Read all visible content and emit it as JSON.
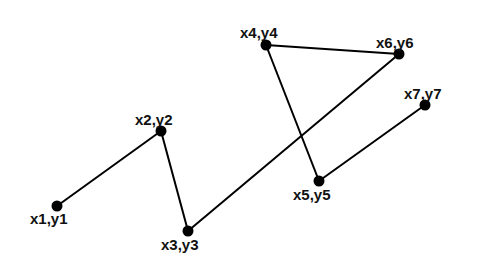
{
  "diagram": {
    "type": "polyline-graph",
    "background": "#ffffff",
    "stroke_color": "#000000",
    "points": [
      {
        "id": "p1",
        "label": "x1,y1",
        "x": 57,
        "y": 206,
        "label_x": 30,
        "label_y": 224
      },
      {
        "id": "p2",
        "label": "x2,y2",
        "x": 161,
        "y": 131,
        "label_x": 135,
        "label_y": 125
      },
      {
        "id": "p3",
        "label": "x3,y3",
        "x": 188,
        "y": 231,
        "label_x": 161,
        "label_y": 250
      },
      {
        "id": "p4",
        "label": "x4,y4",
        "x": 266,
        "y": 45,
        "label_x": 240,
        "label_y": 38
      },
      {
        "id": "p5",
        "label": "x5,y5",
        "x": 319,
        "y": 181,
        "label_x": 293,
        "label_y": 200
      },
      {
        "id": "p6",
        "label": "x6,y6",
        "x": 399,
        "y": 54,
        "label_x": 376,
        "label_y": 48
      },
      {
        "id": "p7",
        "label": "x7,y7",
        "x": 425,
        "y": 105,
        "label_x": 404,
        "label_y": 99
      }
    ],
    "edges": [
      [
        "p1",
        "p2"
      ],
      [
        "p2",
        "p3"
      ],
      [
        "p3",
        "p6"
      ],
      [
        "p4",
        "p6"
      ],
      [
        "p4",
        "p5"
      ],
      [
        "p5",
        "p7"
      ]
    ]
  }
}
